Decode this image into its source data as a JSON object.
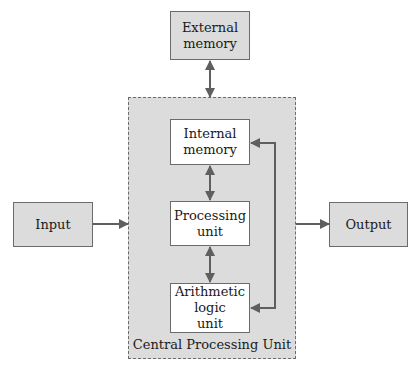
{
  "diagram": {
    "type": "block-diagram",
    "nodes": {
      "external_memory": {
        "label_1": "External",
        "label_2": "memory"
      },
      "input": {
        "label": "Input"
      },
      "output": {
        "label": "Output"
      },
      "internal_memory": {
        "label_1": "Internal",
        "label_2": "memory"
      },
      "processing_unit": {
        "label_1": "Processing",
        "label_2": "unit"
      },
      "alu": {
        "label_1": "Arithmetic",
        "label_2": "logic",
        "label_3": "unit"
      }
    },
    "container": {
      "label": "Central Processing Unit"
    },
    "edges": [
      {
        "from": "external_memory",
        "to": "internal_memory",
        "direction": "bidirectional"
      },
      {
        "from": "input",
        "to": "cpu",
        "direction": "forward"
      },
      {
        "from": "cpu",
        "to": "output",
        "direction": "forward"
      },
      {
        "from": "internal_memory",
        "to": "processing_unit",
        "direction": "bidirectional"
      },
      {
        "from": "processing_unit",
        "to": "alu",
        "direction": "bidirectional"
      },
      {
        "from": "alu",
        "to": "internal_memory",
        "direction": "bidirectional",
        "route": "right-side loop"
      }
    ],
    "colors": {
      "box_fill": "#dcdcdc",
      "inner_fill": "#ffffff",
      "stroke": "#6b6b6b"
    }
  }
}
